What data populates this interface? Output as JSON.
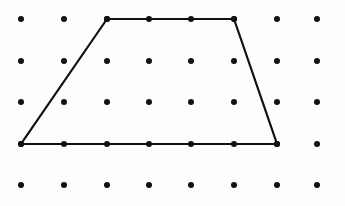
{
  "canvas": {
    "width": 345,
    "height": 206,
    "background_color": "#fdfdfd",
    "ink_color": "#111111"
  },
  "chart_data": {
    "type": "scatter",
    "title": "",
    "subtitle": "",
    "xlabel": "",
    "ylabel": "",
    "grid": false,
    "legend": null,
    "lattice": {
      "columns": 8,
      "rows": 5,
      "column_x": [
        21,
        64,
        107,
        149,
        191,
        234,
        277,
        317
      ],
      "row_y": [
        19,
        61,
        102,
        144,
        185
      ],
      "dot_radius": 3,
      "dot_color": "#111111",
      "spacing_x": 42.5,
      "spacing_y": 41.5
    },
    "shapes": [
      {
        "name": "trapezoid",
        "kind": "polygon",
        "closed": true,
        "stroke_color": "#111111",
        "stroke_width": 2.2,
        "fill": "none",
        "vertices": [
          {
            "label": "top-left",
            "x": 107,
            "y": 19,
            "grid_col": 3,
            "grid_row": 1
          },
          {
            "label": "top-right",
            "x": 234,
            "y": 19,
            "grid_col": 6,
            "grid_row": 1
          },
          {
            "label": "bottom-right",
            "x": 277,
            "y": 144,
            "grid_col": 7,
            "grid_row": 4
          },
          {
            "label": "bottom-left",
            "x": 21,
            "y": 144,
            "grid_col": 1,
            "grid_row": 4
          }
        ],
        "edge_dot_counts": {
          "top": 4,
          "bottom": 7,
          "left": 2,
          "right": 2
        }
      }
    ]
  }
}
